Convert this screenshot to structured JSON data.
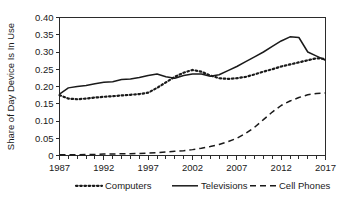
{
  "chart_data": {
    "type": "line",
    "title": "",
    "xlabel": "",
    "ylabel": "Share of Day Device Is In Use",
    "xlim": [
      1987,
      2017
    ],
    "ylim": [
      0,
      0.4
    ],
    "ytick_labels": [
      "0.40",
      "0.35",
      "0.30",
      "0.25",
      "0.20",
      "0.15",
      "0.10",
      "0.05",
      "0"
    ],
    "ytick_values": [
      0.4,
      0.35,
      0.3,
      0.25,
      0.2,
      0.15,
      0.1,
      0.05,
      0
    ],
    "xtick_labels": [
      "1987",
      "1992",
      "1997",
      "2002",
      "2007",
      "2012",
      "2017"
    ],
    "xtick_values": [
      1987,
      1992,
      1997,
      2002,
      2007,
      2012,
      2017
    ],
    "minor_xticks_every": 1,
    "grid": false,
    "legend_position": "bottom",
    "x": [
      1987,
      1988,
      1989,
      1990,
      1991,
      1992,
      1993,
      1994,
      1995,
      1996,
      1997,
      1998,
      1999,
      2000,
      2001,
      2002,
      2003,
      2004,
      2005,
      2006,
      2007,
      2008,
      2009,
      2010,
      2011,
      2012,
      2013,
      2014,
      2015,
      2016,
      2017
    ],
    "series": [
      {
        "name": "Computers",
        "style": "dotted",
        "color": "#1a1a1a",
        "values": [
          0.175,
          0.165,
          0.163,
          0.165,
          0.168,
          0.17,
          0.172,
          0.174,
          0.176,
          0.178,
          0.182,
          0.196,
          0.212,
          0.228,
          0.24,
          0.248,
          0.243,
          0.232,
          0.224,
          0.222,
          0.224,
          0.228,
          0.235,
          0.243,
          0.25,
          0.258,
          0.264,
          0.27,
          0.276,
          0.282,
          0.28
        ]
      },
      {
        "name": "Televisions",
        "style": "solid",
        "color": "#1a1a1a",
        "values": [
          0.178,
          0.196,
          0.2,
          0.203,
          0.208,
          0.212,
          0.214,
          0.22,
          0.222,
          0.226,
          0.232,
          0.236,
          0.228,
          0.224,
          0.232,
          0.236,
          0.236,
          0.23,
          0.234,
          0.246,
          0.258,
          0.272,
          0.286,
          0.3,
          0.316,
          0.332,
          0.344,
          0.342,
          0.3,
          0.288,
          0.276
        ]
      },
      {
        "name": "Cell Phones",
        "style": "dashed",
        "color": "#1a1a1a",
        "values": [
          0.002,
          0.002,
          0.002,
          0.003,
          0.003,
          0.004,
          0.004,
          0.005,
          0.005,
          0.006,
          0.007,
          0.008,
          0.01,
          0.012,
          0.014,
          0.017,
          0.021,
          0.026,
          0.032,
          0.04,
          0.05,
          0.064,
          0.082,
          0.104,
          0.126,
          0.145,
          0.158,
          0.168,
          0.176,
          0.18,
          0.181
        ]
      }
    ]
  },
  "legend": {
    "items": [
      {
        "label": "Computers",
        "style": "dotted"
      },
      {
        "label": "Televisions",
        "style": "solid"
      },
      {
        "label": "Cell Phones",
        "style": "dashed"
      }
    ]
  }
}
